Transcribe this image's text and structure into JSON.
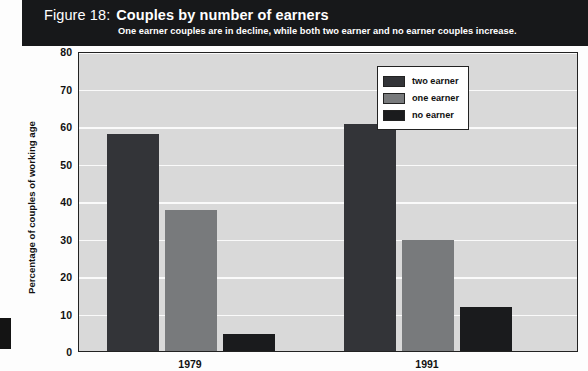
{
  "header": {
    "figure_label": "Figure 18:",
    "title": "Couples by number of earners",
    "subtitle": "One earner couples are in decline, while both two earner and no earner couples increase.",
    "background_color": "#17181a",
    "text_color": "#ffffff"
  },
  "chart_data": {
    "type": "bar",
    "title": "Couples by number of earners",
    "subtitle": "One earner couples are in decline, while both two earner and no earner couples increase.",
    "xlabel": "",
    "ylabel": "Percentage of couples of working age",
    "categories": [
      "1979",
      "1991"
    ],
    "series": [
      {
        "name": "two earner",
        "values": [
          58.0,
          60.5
        ],
        "color": "#333438"
      },
      {
        "name": "one earner",
        "values": [
          37.5,
          29.5
        ],
        "color": "#787a7c"
      },
      {
        "name": "no earner",
        "values": [
          4.5,
          11.8
        ],
        "color": "#1a1b1d"
      }
    ],
    "ylim": [
      0,
      80
    ],
    "yticks": [
      0,
      10,
      20,
      30,
      40,
      50,
      60,
      70,
      80
    ],
    "ytick_labels": [
      "0",
      "10",
      "20",
      "30",
      "40",
      "50",
      "60",
      "70",
      "80"
    ],
    "grid": true,
    "grid_color": "#fafafa",
    "plot_background": "#d9d9d9",
    "legend_position": "upper right",
    "legend_entries": [
      "two earner",
      "one earner",
      "no earner"
    ]
  }
}
